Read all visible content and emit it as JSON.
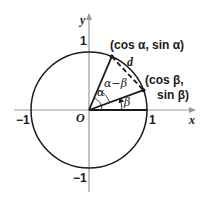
{
  "diagram": {
    "colors": {
      "axis": "#9a9a9a",
      "curve": "#1a1a1a",
      "text": "#1a1a1a",
      "background": "#ffffff"
    },
    "axes": {
      "x_label": "x",
      "y_label": "y",
      "origin_label": "O",
      "tick_labels": {
        "x_pos": "1",
        "x_neg": "−1",
        "y_pos": "1",
        "y_neg": "−1"
      }
    },
    "circle": {
      "type": "unit circle",
      "radius": 1
    },
    "points": [
      {
        "name": "alpha-point",
        "label": "(cos α, sin α)",
        "angle_deg": 67
      },
      {
        "name": "beta-point",
        "label_line1": "(cos β,",
        "label_line2": "sin β)",
        "angle_deg": 20
      }
    ],
    "chord_label": "d",
    "angle_labels": {
      "alpha": "α",
      "beta": "β",
      "alpha_minus_beta": "α−β"
    }
  }
}
